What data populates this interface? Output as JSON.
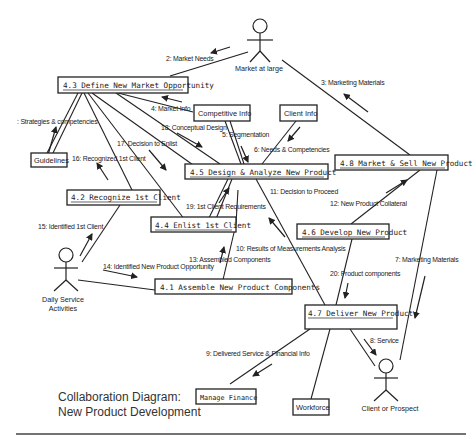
{
  "title": {
    "line1": "Collaboration Diagram:",
    "line2": "New Product Development"
  },
  "actors": {
    "market": "Market at large",
    "daily_1": "Daily Service",
    "daily_2": "Activities",
    "client": "Client or Prospect"
  },
  "processes": {
    "p43": "4.3 Define New Market Opportunity",
    "p42": "4.2 Recognize 1st Client",
    "p45": "4.5 Design & Analyze New Product",
    "p44": "4.4 Enlist 1st Client",
    "p41": "4.1 Assemble New Product Components",
    "p48": "4.8 Market & Sell New Product",
    "p46": "4.6 Develop New Product",
    "p47": "4.7 Deliver New Product",
    "finance": "Manage Finance"
  },
  "objects": {
    "competitive": "Competitive Info",
    "client_info": "Client Info",
    "guidelines": "Guidelines",
    "workforce": "Workforce"
  },
  "messages": {
    "m2": "2: Market Needs",
    "m3": "3: Marketing Materials",
    "m4": "4: Market Info",
    "m1": ": Strategies & competencies",
    "m18": "18: Conceptual Design",
    "m5": "5: Segmentation",
    "m17": "17: Decision to Enlist",
    "m6": "6: Needs & Competencies",
    "m16": "16: Recognized 1st Client",
    "m11": "11: Decision to Proceed",
    "m19": "19: 1st Client Requirements",
    "m12": "12: New Product Collateral",
    "m15": "15: Identified 1st Client",
    "m10": "10: Results of Measurements Analysis",
    "m13": "13: Assembled Components",
    "m14": "14: Identified New Product Opportunity",
    "m20": "20: Product components",
    "m7": "7: Marketing Materials",
    "m8": "8: Service",
    "m9": "9: Delivered Service & Financial Info"
  }
}
